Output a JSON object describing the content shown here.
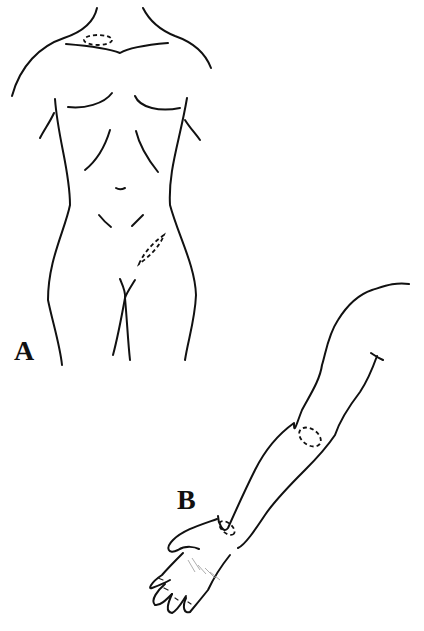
{
  "figure": {
    "panels": [
      {
        "label": "A",
        "subject": "female-torso-front",
        "marked_sites": [
          "supraclavicular-neck",
          "left-inguinal"
        ]
      },
      {
        "label": "B",
        "subject": "right-arm-extended",
        "marked_sites": [
          "antecubital-elbow",
          "wrist"
        ]
      }
    ],
    "colors": {
      "ink": "#111111",
      "background": "#ffffff"
    }
  }
}
